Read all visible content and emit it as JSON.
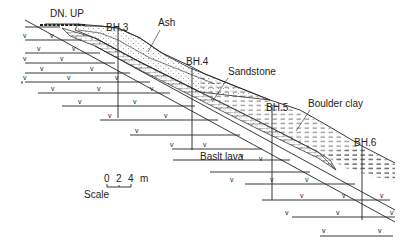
{
  "diagram": {
    "type": "geological-cross-section",
    "labels": {
      "stairs": "DN. UP",
      "ash": "Ash",
      "sandstone": "Sandstone",
      "boulder_clay": "Boulder clay",
      "basalt_lava": "Baslt lava",
      "scale_word": "Scale",
      "scale_unit": "m"
    },
    "boreholes": [
      {
        "id": "BH.3",
        "x": 118,
        "label_y": 31,
        "bottom": 118
      },
      {
        "id": "BH.4",
        "x": 192,
        "label_y": 65,
        "bottom": 150
      },
      {
        "id": "BH.5",
        "x": 272,
        "label_y": 111,
        "bottom": 200
      },
      {
        "id": "BH.6",
        "x": 362,
        "label_y": 146,
        "bottom": 218
      }
    ],
    "scale": {
      "ticks": [
        "0",
        "2",
        "4"
      ]
    },
    "colors": {
      "ink": "#222222",
      "background": "#ffffff"
    }
  }
}
